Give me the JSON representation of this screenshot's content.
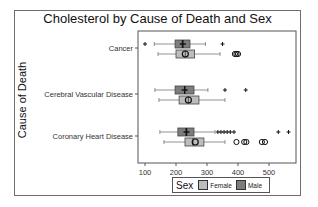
{
  "chart_data": {
    "type": "boxplot",
    "title": "Cholesterol by Cause of Death and Sex",
    "xlabel": "",
    "ylabel": "Cause of Death",
    "orientation": "horizontal",
    "xlim": [
      80,
      580
    ],
    "x_ticks": [
      100,
      200,
      300,
      400,
      500
    ],
    "categories": [
      "Cancer",
      "Cerebral Vascular Disease",
      "Coronary Heart Disease"
    ],
    "legend": {
      "title": "Sex",
      "position": "bottom",
      "entries": [
        "Female",
        "Male"
      ]
    },
    "colors": {
      "Female": "#bdbdbd",
      "Male": "#7d7d7d"
    },
    "series": [
      {
        "name": "Male",
        "boxes": [
          {
            "category": "Cancer",
            "whisker_low": 130,
            "q1": 197,
            "median": 220,
            "mean": 222,
            "q3": 245,
            "whisker_high": 295,
            "outliers": [
              100,
              350
            ]
          },
          {
            "category": "Cerebral Vascular Disease",
            "whisker_low": 132,
            "q1": 197,
            "median": 228,
            "mean": 228,
            "q3": 258,
            "whisker_high": 303,
            "outliers": [
              358,
              425
            ]
          },
          {
            "category": "Coronary Heart Disease",
            "whisker_low": 148,
            "q1": 206,
            "median": 232,
            "mean": 234,
            "q3": 258,
            "whisker_high": 326,
            "outliers": [
              335,
              345,
              355,
              365,
              375,
              387,
              530,
              563
            ]
          }
        ]
      },
      {
        "name": "Female",
        "boxes": [
          {
            "category": "Cancer",
            "whisker_low": 142,
            "q1": 200,
            "median": 230,
            "mean": 230,
            "q3": 260,
            "whisker_high": 342,
            "outliers": [
              390,
              395,
              400
            ]
          },
          {
            "category": "Cerebral Vascular Disease",
            "whisker_low": 145,
            "q1": 210,
            "median": 240,
            "mean": 240,
            "q3": 274,
            "whisker_high": 358,
            "outliers": []
          },
          {
            "category": "Coronary Heart Disease",
            "whisker_low": 161,
            "q1": 229,
            "median": 255,
            "mean": 262,
            "q3": 290,
            "whisker_high": 358,
            "outliers": [
              395,
              420,
              427,
              477,
              487
            ]
          }
        ]
      }
    ]
  },
  "legend": {
    "title": "Sex",
    "female": "Female",
    "male": "Male"
  },
  "title": "Cholesterol by Cause of Death and Sex",
  "ylabel": "Cause of Death"
}
